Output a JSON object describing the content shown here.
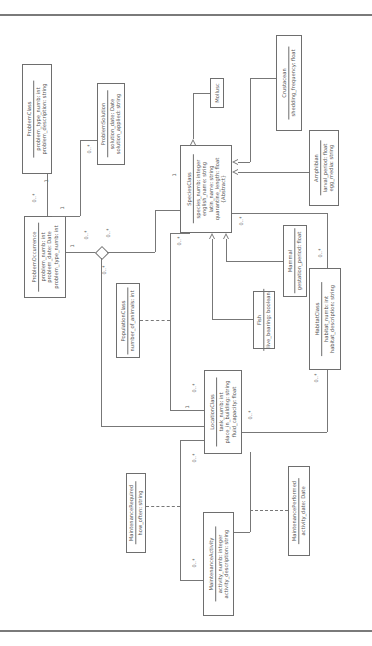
{
  "diagram": {
    "type": "UML class diagram (rotated 90° counter-clockwise)",
    "classes": {
      "problem_class": {
        "name": "ProblemClass",
        "attrs": [
          "problem_type_numb: int",
          "problem_description: string"
        ]
      },
      "problem_solution": {
        "name": "ProblemSolution",
        "attrs": [
          "solution_date: Date",
          "solution_applied: string"
        ]
      },
      "problem_occurrence": {
        "name": "ProblemOccurrence",
        "attrs": [
          "problem_numb: int",
          "problem_date: Date",
          "problem_type_numb: int"
        ]
      },
      "species_class": {
        "name": "SpeciesClass",
        "attrs": [
          "species_numb: integer",
          "english_name: string",
          "latin_name: string",
          "quarantine_length: float",
          "{Abstract}"
        ]
      },
      "mollusc": {
        "name": "Mollusc",
        "attrs": []
      },
      "crustacean": {
        "name": "Crustacean",
        "attrs": [
          "shedding_frequency: float"
        ]
      },
      "amphibian": {
        "name": "Amphibian",
        "attrs": [
          "larval_period: float",
          "egg_media: string"
        ]
      },
      "mammal": {
        "name": "Mammal",
        "attrs": [
          "gestation_period: float"
        ]
      },
      "fish": {
        "name": "Fish",
        "attrs": [
          "live_bearing: boolean"
        ]
      },
      "habitat_class": {
        "name": "HabitatClass",
        "attrs": [
          "habitat_numb: int",
          "habitat_description: string"
        ]
      },
      "population_class": {
        "name": "PopulationClass",
        "attrs": [
          "number_of_animals: int"
        ]
      },
      "location_class": {
        "name": "LocationClass",
        "attrs": [
          "tank_numb: int",
          "place_in_building: string",
          "fluid_capacity: float"
        ]
      },
      "maintenance_required": {
        "name": "MaintenanceRequired",
        "attrs": [
          "how_often: string"
        ]
      },
      "maintenance_activity": {
        "name": "MaintenanceActivity",
        "attrs": [
          "activity_numb: integer",
          "activity_description: string"
        ]
      },
      "maintenance_performed": {
        "name": "MaintenancePerformed",
        "attrs": [
          "activity_date: Date"
        ]
      }
    },
    "multiplicities": {
      "pc_one": "1",
      "po_many": "0..*",
      "ps_many": "0..*",
      "ps_one": "1",
      "po_one": "1",
      "dia_many1": "0..*",
      "dia_many2": "0..*",
      "dia_many3": "0..*",
      "sc_one": "1",
      "sc_many": "0..*",
      "hab_many": "0..*",
      "hab_many2": "0..*",
      "loc_one": "1",
      "loc_many": "0..*",
      "loc_many2": "0..*",
      "loc_many3": "0..*",
      "ma_many": "0..*",
      "ma_many2": "0..*"
    }
  }
}
